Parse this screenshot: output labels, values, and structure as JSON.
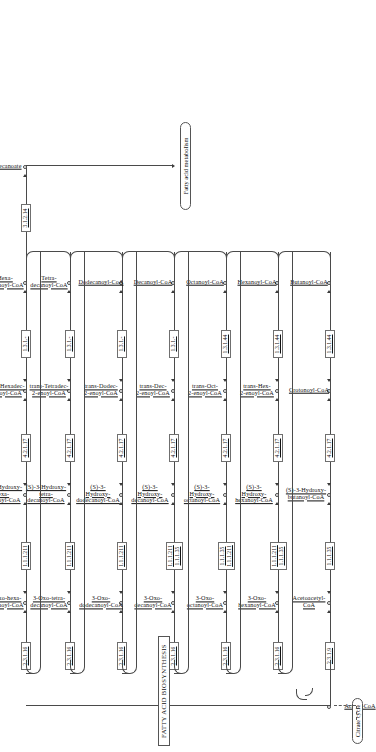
{
  "map": {
    "title": "FATTY ACID BIOSYNTHESIS",
    "seed_compound": "Acetyl-CoA",
    "citrate_cycle_label": "Citrate cycle",
    "fatty_acid_metabolism_label": "Fatty acid metabolism",
    "terminal_product": "Hexadecanoate",
    "terminal_enzyme": "3.1.2.14"
  },
  "rows": [
    {
      "id": "butanoyl",
      "condensing_enzyme": "2.3.1.9",
      "oxo_compound": "Acetoacetyl-\nCoA",
      "oxo_compound_lines": [
        "Acetoacetyl-",
        "CoA"
      ],
      "reductase": [
        "1.1.1.35"
      ],
      "hydroxy_compound_lines": [
        "(S)-3-Hydroxy-",
        "butanoyl-CoA"
      ],
      "dehydratase": "4.2.1.17",
      "enoyl_compound_lines": [
        "Crotonoyl-CoA"
      ],
      "enoyl_reductase": "1.3.1.44",
      "acyl_compound_lines": [
        "Butanoyl-CoA"
      ]
    },
    {
      "id": "hexanoyl",
      "condensing_enzyme": "2.3.1.16",
      "oxo_compound_lines": [
        "3-Oxo-",
        "hexanoyl-CoA"
      ],
      "reductase": [
        "1.1.1.211",
        "1.1.1.35"
      ],
      "hydroxy_compound_lines": [
        "(S)-3-",
        "Hydroxy-",
        "hexanoyl-CoA"
      ],
      "dehydratase": "4.2.1.17",
      "enoyl_compound_lines": [
        "trans-Hex-",
        "2-enoyl-CoA"
      ],
      "enoyl_reductase": "1.3.1.44",
      "acyl_compound_lines": [
        "Hexanoyl-CoA"
      ]
    },
    {
      "id": "octanoyl",
      "condensing_enzyme": "2.3.1.16",
      "oxo_compound_lines": [
        "3-Oxo-",
        "octanoyl-CoA"
      ],
      "reductase": [
        "1.1.1.35",
        "1.1.1.211"
      ],
      "hydroxy_compound_lines": [
        "(S)-3-",
        "Hydroxy-",
        "octanoyl-CoA"
      ],
      "dehydratase": "4.2.1.17",
      "enoyl_compound_lines": [
        "trans-Oct-",
        "2-enoyl-CoA"
      ],
      "enoyl_reductase": "1.3.1.44",
      "acyl_compound_lines": [
        "Octanoyl-CoA"
      ]
    },
    {
      "id": "decanoyl",
      "condensing_enzyme": "2.3.1.16",
      "oxo_compound_lines": [
        "3-Oxo-",
        "decanoyl-CoA"
      ],
      "reductase": [
        "1.1.1.211",
        "1.1.1.35"
      ],
      "hydroxy_compound_lines": [
        "(S)-3-",
        "Hydroxy-",
        "decanoyl-CoA"
      ],
      "dehydratase": "4.2.1.17",
      "enoyl_compound_lines": [
        "trans-Dec-",
        "2-enoyl-CoA"
      ],
      "enoyl_reductase": "1.3.1.-",
      "acyl_compound_lines": [
        "Decanoyl-CoA"
      ]
    },
    {
      "id": "dodecanoyl",
      "condensing_enzyme": "2.3.1.16",
      "oxo_compound_lines": [
        "3-Oxo-",
        "dodecanoyl-CoA"
      ],
      "reductase": [
        "1.1.1.211"
      ],
      "hydroxy_compound_lines": [
        "(S)-3-",
        "Hydroxy-",
        "dodecanoyl-CoA"
      ],
      "dehydratase": "4.2.1.17",
      "enoyl_compound_lines": [
        "trans-Dodec-",
        "2-enoyl-CoA"
      ],
      "enoyl_reductase": "1.3.1.-",
      "acyl_compound_lines": [
        "Dodecanoyl-CoA"
      ]
    },
    {
      "id": "tetradecanoyl",
      "condensing_enzyme": "2.3.1.16",
      "oxo_compound_lines": [
        "3-Oxo-tetra-",
        "decanoyl-CoA"
      ],
      "reductase": [
        "1.1.1.211"
      ],
      "hydroxy_compound_lines": [
        "(S)-3-Hydroxy-",
        "tetra-",
        "decanoyl-CoA"
      ],
      "dehydratase": "4.2.1.17",
      "enoyl_compound_lines": [
        "trans-Tetradec-",
        "2-enoyl-CoA"
      ],
      "enoyl_reductase": "1.3.1.-",
      "acyl_compound_lines": [
        "Tetra-",
        "decanoyl-CoA"
      ]
    },
    {
      "id": "hexadecanoyl",
      "condensing_enzyme": "2.3.1.16",
      "oxo_compound_lines": [
        "3-Oxo-hexa-",
        "decanoyl-CoA"
      ],
      "reductase": [
        "1.1.1.211"
      ],
      "hydroxy_compound_lines": [
        "(S)-3-Hydroxy-",
        "hexa-",
        "decanoyl-CoA"
      ],
      "dehydratase": "4.2.1.17",
      "enoyl_compound_lines": [
        "trans-Hexadec-",
        "2-enoyl-CoA"
      ],
      "enoyl_reductase": "1.3.1.-",
      "acyl_compound_lines": [
        "Hexa-",
        "decanoyl-CoA"
      ]
    }
  ],
  "colors": {
    "line": "#4a4a4a",
    "box_border": "#6f6f6f",
    "text": "#111111",
    "background": "#ffffff"
  }
}
